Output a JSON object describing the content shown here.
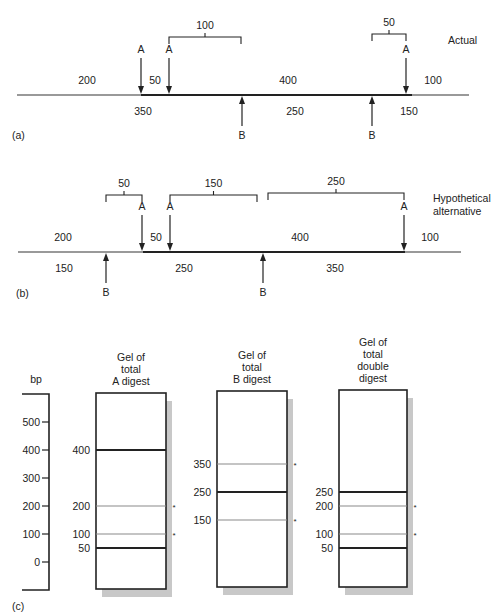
{
  "panel_a": {
    "tag": "(a)",
    "title": "Actual",
    "map_line": {
      "x_start": 17,
      "x_end": 469,
      "thick_start": 141,
      "thick_end": 412,
      "y": 95
    },
    "a_sites": [
      141,
      169,
      406
    ],
    "b_sites": [
      242,
      372
    ],
    "a_site_label": "A",
    "b_site_label": "B",
    "top_segments": [
      {
        "label": "200",
        "x": 87
      },
      {
        "label": "50",
        "x": 155
      },
      {
        "label": "400",
        "x": 288
      },
      {
        "label": "100",
        "x": 433
      }
    ],
    "bottom_segments": [
      {
        "label": "350",
        "x": 143
      },
      {
        "label": "250",
        "x": 295
      },
      {
        "label": "150",
        "x": 409
      }
    ],
    "brackets": [
      {
        "label": "100",
        "x1": 169,
        "x2": 241,
        "y": 37
      },
      {
        "label": "50",
        "x1": 372,
        "x2": 406,
        "y": 34
      }
    ]
  },
  "panel_b": {
    "tag": "(b)",
    "title_line1": "Hypothetical",
    "title_line2": "alternative",
    "map_line": {
      "x_start": 18,
      "x_end": 461,
      "thick_start": 143,
      "thick_end": 405,
      "y": 252
    },
    "a_sites": [
      142,
      170,
      404
    ],
    "b_sites": [
      106,
      263
    ],
    "a_site_label": "A",
    "b_site_label": "B",
    "top_segments": [
      {
        "label": "200",
        "x": 63
      },
      {
        "label": "50",
        "x": 156
      },
      {
        "label": "400",
        "x": 300
      },
      {
        "label": "100",
        "x": 430
      }
    ],
    "bottom_segments": [
      {
        "label": "150",
        "x": 64
      },
      {
        "label": "250",
        "x": 184
      },
      {
        "label": "350",
        "x": 335
      }
    ],
    "brackets": [
      {
        "label": "50",
        "x1": 106,
        "x2": 142,
        "y": 195
      },
      {
        "label": "150",
        "x1": 170,
        "x2": 257,
        "y": 195
      },
      {
        "label": "250",
        "x1": 268,
        "x2": 404,
        "y": 193
      }
    ]
  },
  "panel_c": {
    "tag": "(c)",
    "scale": {
      "unit_label": "bp",
      "ticks": [
        "500",
        "400",
        "300",
        "200",
        "100",
        "0"
      ],
      "tick_values": [
        500,
        400,
        300,
        200,
        100,
        0
      ]
    },
    "gels": [
      {
        "title_lines": [
          "Gel of",
          "total",
          "A digest"
        ],
        "bands": [
          {
            "size": 400,
            "label": "400",
            "strong": true,
            "asterisk": false
          },
          {
            "size": 200,
            "label": "200",
            "strong": false,
            "asterisk": true
          },
          {
            "size": 100,
            "label": "100",
            "strong": false,
            "asterisk": true
          },
          {
            "size": 50,
            "label": "50",
            "strong": true,
            "asterisk": false
          }
        ]
      },
      {
        "title_lines": [
          "Gel of",
          "total",
          "B digest"
        ],
        "bands": [
          {
            "size": 350,
            "label": "350",
            "strong": false,
            "asterisk": true
          },
          {
            "size": 250,
            "label": "250",
            "strong": true,
            "asterisk": false
          },
          {
            "size": 150,
            "label": "150",
            "strong": false,
            "asterisk": true
          }
        ]
      },
      {
        "title_lines": [
          "Gel of",
          "total",
          "double",
          "digest"
        ],
        "bands": [
          {
            "size": 250,
            "label": "250",
            "strong": true,
            "asterisk": false
          },
          {
            "size": 200,
            "label": "200",
            "strong": false,
            "asterisk": true
          },
          {
            "size": 100,
            "label": "100",
            "strong": false,
            "asterisk": true
          },
          {
            "size": 50,
            "label": "50",
            "strong": true,
            "asterisk": false
          }
        ]
      }
    ],
    "asterisk_symbol": "*"
  },
  "colors": {
    "ink": "#222222",
    "thin_line": "#777777",
    "band_faint": "#8a8a8a",
    "shadow": "#c8c8c8"
  }
}
